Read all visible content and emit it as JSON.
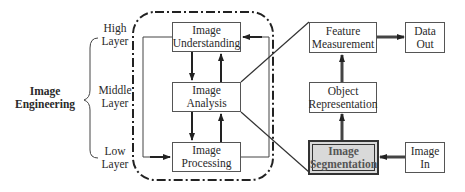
{
  "diagram": {
    "left_title": [
      "Image",
      "Engineering"
    ],
    "layers": [
      {
        "line1": "High",
        "line2": "Layer"
      },
      {
        "line1": "Middle",
        "line2": "Layer"
      },
      {
        "line1": "Low",
        "line2": "Layer"
      }
    ],
    "boxes": {
      "understanding": [
        "Image",
        "Understanding"
      ],
      "analysis": [
        "Image",
        "Analysis"
      ],
      "processing": [
        "Image",
        "Processing"
      ],
      "feature": [
        "Feature",
        "Measurement"
      ],
      "data_out": [
        "Data",
        "Out"
      ],
      "object": [
        "Object",
        "Representation"
      ],
      "segmentation": [
        "Image",
        "Segmentation"
      ],
      "image_in": [
        "Image",
        "In"
      ]
    },
    "highlight_color": "#d9d9d9"
  }
}
